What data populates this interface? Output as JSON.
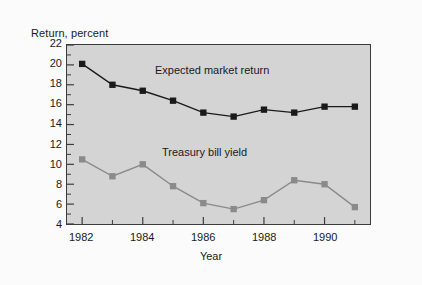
{
  "figure": {
    "background_color": "#fbfbfb",
    "plot_background_color": "#d4d4d4",
    "frame_color": "#3b3b3b"
  },
  "chart_data": {
    "type": "line",
    "title": "",
    "xlabel": "Year",
    "ylabel": "Return, percent",
    "x": [
      1982,
      1983,
      1984,
      1985,
      1986,
      1987,
      1988,
      1989,
      1990,
      1991
    ],
    "xlim": [
      1981.5,
      1991.5
    ],
    "ylim": [
      4,
      22
    ],
    "xticks": [
      1982,
      1984,
      1986,
      1988,
      1990
    ],
    "xtick_labels": [
      "1982",
      "1984",
      "1986",
      "1988",
      "1990"
    ],
    "xticks_minor": [
      1983,
      1985,
      1987,
      1989,
      1991
    ],
    "yticks": [
      4,
      6,
      8,
      10,
      12,
      14,
      16,
      18,
      20,
      22
    ],
    "ytick_labels": [
      "4",
      "6",
      "8",
      "10",
      "12",
      "14",
      "16",
      "18",
      "20",
      "22"
    ],
    "yticks_minor": [
      5,
      7,
      9,
      11,
      13,
      15,
      17,
      19,
      21
    ],
    "grid": false,
    "legend_position": "inline-annotation",
    "series": [
      {
        "name": "Expected market return",
        "color": "#1a1a1a",
        "marker": "square",
        "values": [
          20.1,
          18.0,
          17.4,
          16.4,
          15.2,
          14.8,
          15.5,
          15.2,
          15.8,
          15.8
        ]
      },
      {
        "name": "Treasury bill yield",
        "color": "#8a8a8a",
        "marker": "square",
        "values": [
          10.5,
          8.8,
          10.0,
          7.8,
          6.1,
          5.5,
          6.4,
          8.4,
          8.0,
          5.7
        ]
      }
    ],
    "annotations": [
      {
        "text": "Expected market return",
        "series": "Expected market return"
      },
      {
        "text": "Treasury bill yield",
        "series": "Treasury bill yield"
      }
    ]
  }
}
